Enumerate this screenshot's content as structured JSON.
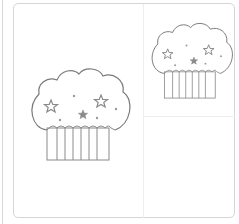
{
  "scene": {
    "description": "Two cupcake line drawings with star and dot sprinkles in a bordered panel",
    "colors": {
      "outline": "#7a7a7a",
      "sprinkle": "#8a8a8a",
      "border": "#d6d6d6",
      "divider": "#eeeeee",
      "background": "#ffffff"
    },
    "cupcakes": [
      {
        "name": "large-cupcake",
        "x": 27,
        "y": 66,
        "scale": 1.0
      },
      {
        "name": "small-cupcake",
        "x": 148,
        "y": 20,
        "scale": 0.82
      }
    ]
  }
}
